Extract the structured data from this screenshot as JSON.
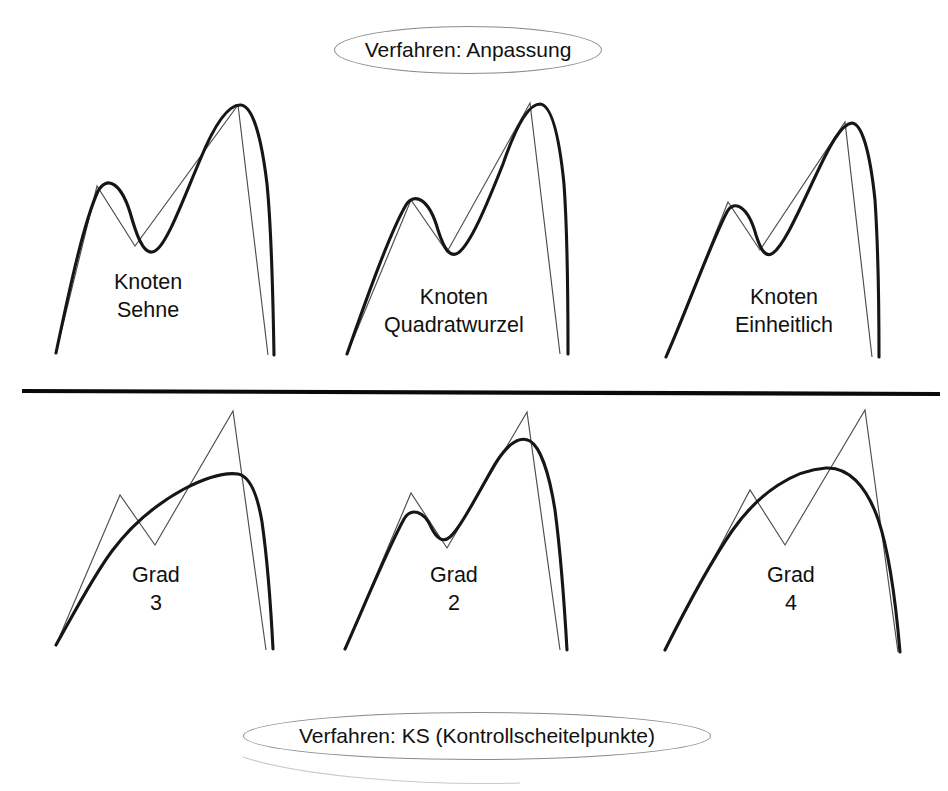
{
  "figure": {
    "title_top": "Verfahren: Anpassung",
    "title_bottom": "Verfahren: KS (Kontrollscheitelpunkte)",
    "divider_present": true,
    "stroke_colors": {
      "control_polygon": "#4d4d4d",
      "fitted_curve": "#161616",
      "divider": "#0a0a0a",
      "banner_outline": "#8a8a8a",
      "background": "#ffffff"
    }
  },
  "panels": {
    "top": [
      {
        "label_line1": "Knoten",
        "label_line2": "Sehne"
      },
      {
        "label_line1": "Knoten",
        "label_line2": "Quadratwurzel"
      },
      {
        "label_line1": "Knoten",
        "label_line2": "Einheitlich"
      }
    ],
    "bottom": [
      {
        "label_line1": "Grad",
        "label_line2": "3"
      },
      {
        "label_line1": "Grad",
        "label_line2": "2"
      },
      {
        "label_line1": "Grad",
        "label_line2": "4"
      }
    ]
  },
  "chart_data": {
    "type": "line",
    "xlabel": "",
    "ylabel": "",
    "grid": false,
    "legend": null,
    "panels": [
      {
        "id": "knoten-sehne",
        "row": "top",
        "label": "Knoten Sehne",
        "control_polygon": [
          [
            56,
            353
          ],
          [
            97,
            186
          ],
          [
            135,
            246
          ],
          [
            238,
            105
          ],
          [
            268,
            355
          ]
        ],
        "curve": [
          [
            56,
            353
          ],
          [
            78,
            245
          ],
          [
            96,
            192
          ],
          [
            112,
            189
          ],
          [
            131,
            233
          ],
          [
            146,
            250
          ],
          [
            167,
            213
          ],
          [
            197,
            148
          ],
          [
            221,
            110
          ],
          [
            240,
            105
          ],
          [
            256,
            140
          ],
          [
            268,
            240
          ],
          [
            273,
            353
          ]
        ]
      },
      {
        "id": "knoten-quadratwurzel",
        "row": "top",
        "label": "Knoten Quadratwurzel",
        "control_polygon": [
          [
            347,
            354
          ],
          [
            411,
            200
          ],
          [
            447,
            252
          ],
          [
            530,
            103
          ],
          [
            560,
            354
          ]
        ],
        "curve": [
          [
            347,
            354
          ],
          [
            382,
            250
          ],
          [
            406,
            200
          ],
          [
            420,
            203
          ],
          [
            442,
            248
          ],
          [
            455,
            253
          ],
          [
            478,
            215
          ],
          [
            510,
            143
          ],
          [
            528,
            107
          ],
          [
            543,
            106
          ],
          [
            555,
            140
          ],
          [
            563,
            240
          ],
          [
            566,
            354
          ]
        ]
      },
      {
        "id": "knoten-einheitlich",
        "row": "top",
        "label": "Knoten Einheitlich",
        "control_polygon": [
          [
            666,
            357
          ],
          [
            728,
            202
          ],
          [
            760,
            250
          ],
          [
            845,
            122
          ],
          [
            872,
            357
          ]
        ],
        "curve": [
          [
            666,
            357
          ],
          [
            700,
            262
          ],
          [
            722,
            209
          ],
          [
            735,
            205
          ],
          [
            750,
            236
          ],
          [
            762,
            253
          ],
          [
            778,
            228
          ],
          [
            808,
            175
          ],
          [
            838,
            128
          ],
          [
            852,
            123
          ],
          [
            864,
            152
          ],
          [
            872,
            242
          ],
          [
            876,
            357
          ]
        ]
      },
      {
        "id": "grad-3",
        "row": "bottom",
        "label": "Grad 3",
        "control_polygon": [
          [
            56,
            645
          ],
          [
            120,
            495
          ],
          [
            155,
            545
          ],
          [
            233,
            411
          ],
          [
            266,
            650
          ]
        ],
        "curve": [
          [
            56,
            645
          ],
          [
            82,
            595
          ],
          [
            105,
            552
          ],
          [
            130,
            519
          ],
          [
            160,
            500
          ],
          [
            192,
            483
          ],
          [
            218,
            474
          ],
          [
            236,
            474
          ],
          [
            249,
            487
          ],
          [
            258,
            520
          ],
          [
            266,
            580
          ],
          [
            272,
            648
          ]
        ]
      },
      {
        "id": "grad-2",
        "row": "bottom",
        "label": "Grad 2",
        "control_polygon": [
          [
            345,
            649
          ],
          [
            411,
            493
          ],
          [
            447,
            548
          ],
          [
            527,
            412
          ],
          [
            560,
            650
          ]
        ],
        "curve": [
          [
            345,
            649
          ],
          [
            374,
            580
          ],
          [
            400,
            517
          ],
          [
            414,
            510
          ],
          [
            432,
            525
          ],
          [
            447,
            539
          ],
          [
            463,
            522
          ],
          [
            492,
            470
          ],
          [
            514,
            443
          ],
          [
            530,
            442
          ],
          [
            543,
            465
          ],
          [
            553,
            520
          ],
          [
            562,
            600
          ],
          [
            566,
            650
          ]
        ]
      },
      {
        "id": "grad-4",
        "row": "bottom",
        "label": "Grad 4",
        "control_polygon": [
          [
            665,
            650
          ],
          [
            750,
            490
          ],
          [
            785,
            545
          ],
          [
            865,
            410
          ],
          [
            898,
            652
          ]
        ],
        "curve": [
          [
            665,
            650
          ],
          [
            692,
            586
          ],
          [
            720,
            538
          ],
          [
            752,
            500
          ],
          [
            790,
            476
          ],
          [
            826,
            468
          ],
          [
            852,
            473
          ],
          [
            870,
            496
          ],
          [
            884,
            540
          ],
          [
            894,
            595
          ],
          [
            900,
            652
          ]
        ]
      }
    ]
  }
}
